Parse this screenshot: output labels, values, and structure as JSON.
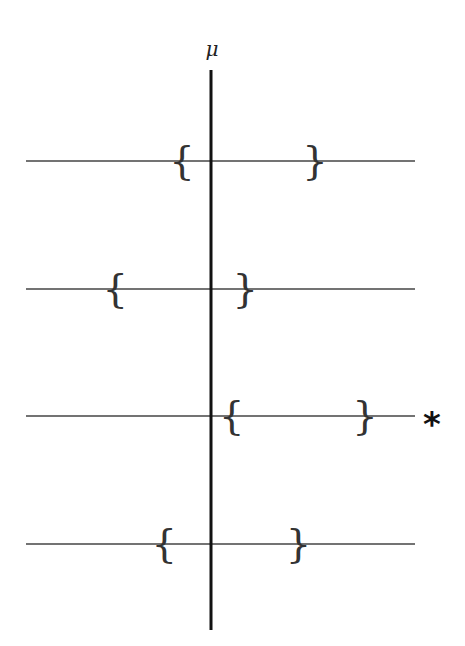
{
  "diagram": {
    "title": "",
    "parameter_label": "μ",
    "true_value": 0,
    "interval_left_symbol": "{",
    "interval_right_symbol": "}",
    "miss_marker": "*",
    "intervals": [
      {
        "lower": -0.28,
        "upper": 1.0,
        "contains_mu": true,
        "marked": false
      },
      {
        "lower": -0.92,
        "upper": 0.33,
        "contains_mu": true,
        "marked": false
      },
      {
        "lower": 0.2,
        "upper": 1.48,
        "contains_mu": false,
        "marked": true
      },
      {
        "lower": -0.45,
        "upper": 0.84,
        "contains_mu": true,
        "marked": false
      }
    ],
    "x_range": [
      -1.78,
      1.96
    ]
  },
  "colors": {
    "axis": "#111111",
    "interval_line": "#444444",
    "brace": "#333333",
    "marker": "#111111"
  }
}
